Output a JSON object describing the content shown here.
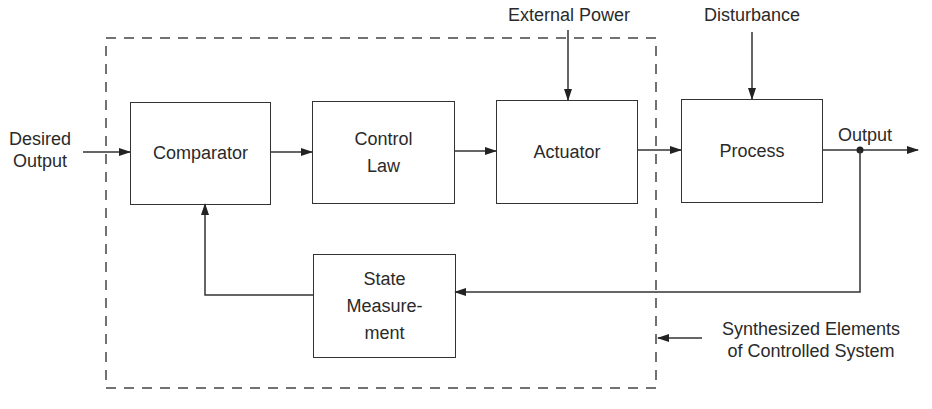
{
  "diagram": {
    "type": "control-system-block-diagram",
    "boundary_label": [
      "Synthesized Elements",
      "of Controlled System"
    ],
    "inputs": {
      "desired_output": [
        "Desired",
        "Output"
      ],
      "external_power": "External Power",
      "disturbance": "Disturbance"
    },
    "output_label": "Output",
    "blocks": {
      "comparator": [
        "Comparator"
      ],
      "control_law": [
        "Control",
        "Law"
      ],
      "actuator": [
        "Actuator"
      ],
      "process": [
        "Process"
      ],
      "state_measurement": [
        "State",
        "Measure-",
        "ment"
      ]
    },
    "connections": [
      {
        "from": "Desired Output",
        "to": "Comparator"
      },
      {
        "from": "Comparator",
        "to": "Control Law"
      },
      {
        "from": "Control Law",
        "to": "Actuator"
      },
      {
        "from": "External Power",
        "to": "Actuator"
      },
      {
        "from": "Actuator",
        "to": "Process"
      },
      {
        "from": "Disturbance",
        "to": "Process"
      },
      {
        "from": "Process",
        "to": "Output"
      },
      {
        "from": "Output",
        "to": "State Measurement"
      },
      {
        "from": "State Measurement",
        "to": "Comparator"
      }
    ],
    "colors": {
      "line": "#333333",
      "text": "#2a2a2a",
      "background": "#ffffff"
    }
  }
}
